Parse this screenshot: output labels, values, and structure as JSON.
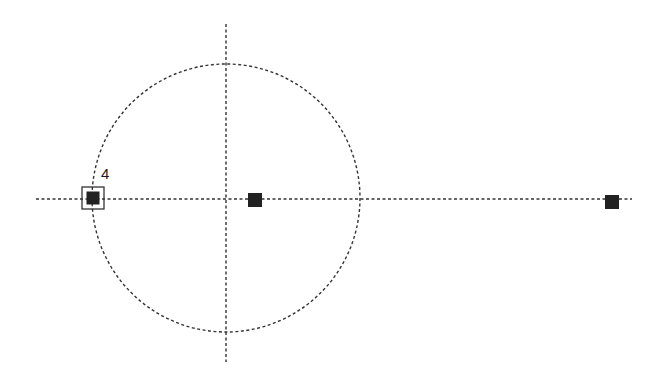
{
  "diagram": {
    "background": "#ffffff",
    "stroke_color": "#333333",
    "fill_color": "#222222",
    "axes": {
      "vertical": {
        "x": 226,
        "y1": 24,
        "y2": 362
      },
      "horizontal": {
        "y": 199,
        "x1": 36,
        "x2": 632
      }
    },
    "circle": {
      "cx": 226,
      "cy": 198,
      "r": 134
    },
    "points": [
      {
        "id": "point-1",
        "x": 93,
        "y": 198,
        "size": 13,
        "selected": true,
        "label": "4"
      },
      {
        "id": "point-2",
        "x": 255,
        "y": 200,
        "size": 14,
        "selected": false
      },
      {
        "id": "point-3",
        "x": 612,
        "y": 202,
        "size": 14,
        "selected": false
      }
    ]
  }
}
